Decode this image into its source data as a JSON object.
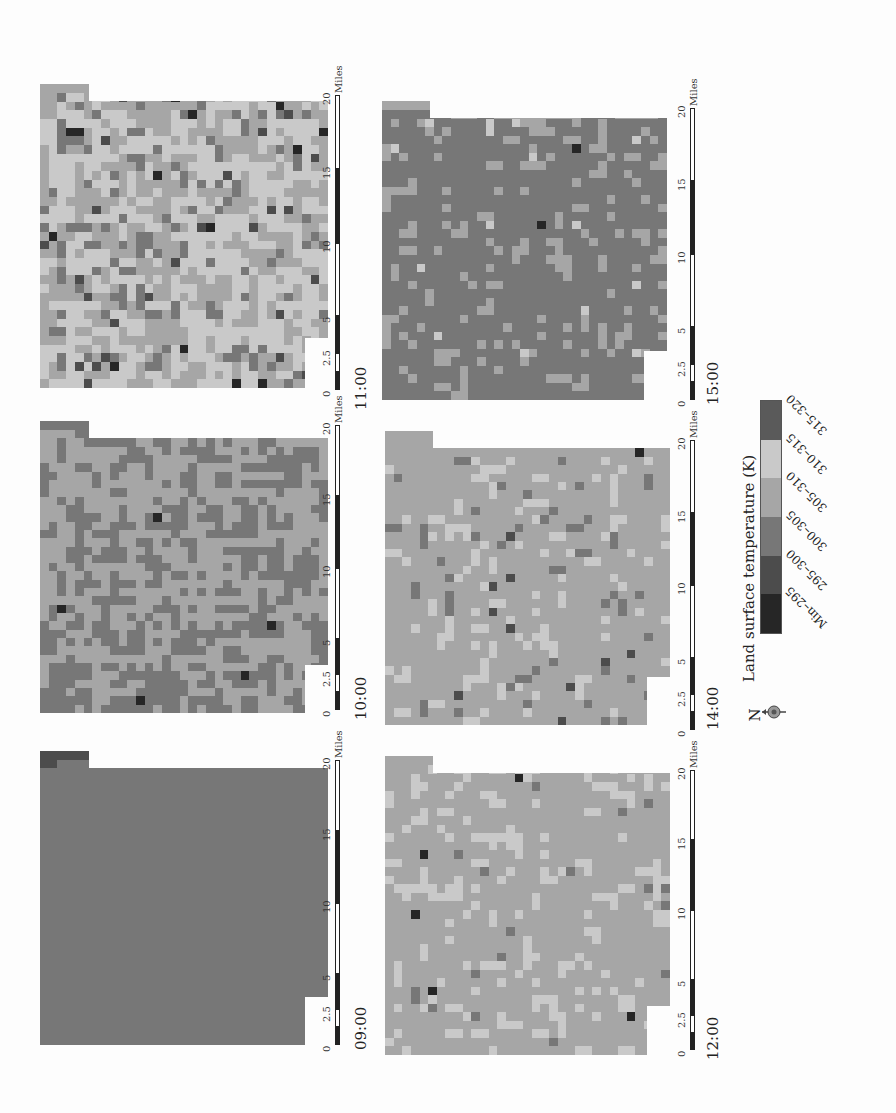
{
  "figure": {
    "orientation": "rotated 90deg clockwise",
    "legend": {
      "title": "Land surface temperature (K)",
      "classes": [
        {
          "label": "315–320",
          "color": "#5a5a5a"
        },
        {
          "label": "310–315",
          "color": "#c9c9c9"
        },
        {
          "label": "305–310",
          "color": "#a6a6a6"
        },
        {
          "label": "300–305",
          "color": "#777777"
        },
        {
          "label": "295–300",
          "color": "#4c4c4c"
        },
        {
          "label": "Min–295",
          "color": "#262626"
        }
      ]
    },
    "north_arrow": {
      "label": "N"
    },
    "scalebar": {
      "ticks": [
        "0",
        "2.5",
        "5",
        "10",
        "15",
        "20"
      ],
      "unit": "Miles"
    },
    "panels": [
      {
        "id": "p1100",
        "time": "11:00",
        "x": 40,
        "y": 93,
        "w": 288,
        "h": 295,
        "base": "#a6a6a6",
        "accents": [
          "#c9c9c9",
          "#777777",
          "#4c4c4c",
          "#262626"
        ],
        "weights": [
          0.24,
          0.08,
          0.02,
          0.01
        ],
        "scalebar_x": 335,
        "scalebar_y1": 95,
        "scalebar_y2": 390,
        "label_x": 360,
        "label_y": 410
      },
      {
        "id": "p1000",
        "time": "10:00",
        "x": 40,
        "y": 430,
        "w": 288,
        "h": 283,
        "base": "#777777",
        "accents": [
          "#a6a6a6",
          "#262626"
        ],
        "weights": [
          0.26,
          0.003
        ],
        "scalebar_x": 335,
        "scalebar_y1": 425,
        "scalebar_y2": 710,
        "label_x": 360,
        "label_y": 720
      },
      {
        "id": "p0900",
        "time": "09:00",
        "x": 40,
        "y": 760,
        "w": 288,
        "h": 285,
        "base": "#4c4c4c",
        "accents": [
          "#777777",
          "#a6a6a6",
          "#c9c9c9",
          "#262626"
        ],
        "weights": [
          0.5,
          0.005,
          0.005,
          0.003
        ],
        "scalebar_x": 335,
        "scalebar_y1": 760,
        "scalebar_y2": 1045,
        "label_x": 360,
        "label_y": 1050
      },
      {
        "id": "p1500",
        "time": "15:00",
        "x": 382,
        "y": 110,
        "w": 285,
        "h": 290,
        "base": "#a6a6a6",
        "accents": [
          "#777777",
          "#c9c9c9",
          "#262626"
        ],
        "weights": [
          0.35,
          0.01,
          0.002
        ],
        "scalebar_x": 690,
        "scalebar_y1": 108,
        "scalebar_y2": 400,
        "label_x": 712,
        "label_y": 405
      },
      {
        "id": "p1400",
        "time": "14:00",
        "x": 385,
        "y": 440,
        "w": 285,
        "h": 285,
        "base": "#a6a6a6",
        "accents": [
          "#c9c9c9",
          "#777777",
          "#4c4c4c",
          "#262626"
        ],
        "weights": [
          0.1,
          0.05,
          0.01,
          0.003
        ],
        "scalebar_x": 690,
        "scalebar_y1": 440,
        "scalebar_y2": 730,
        "label_x": 712,
        "label_y": 730
      },
      {
        "id": "p1200",
        "time": "12:00",
        "x": 385,
        "y": 765,
        "w": 285,
        "h": 290,
        "base": "#a6a6a6",
        "accents": [
          "#c9c9c9",
          "#777777",
          "#262626"
        ],
        "weights": [
          0.12,
          0.02,
          0.002
        ],
        "scalebar_x": 690,
        "scalebar_y1": 770,
        "scalebar_y2": 1050,
        "label_x": 712,
        "label_y": 1060
      }
    ]
  },
  "chart_data": {
    "type": "heatmap",
    "title": "Land surface temperature (K)",
    "panels": [
      "09:00",
      "10:00",
      "11:00",
      "12:00",
      "14:00",
      "15:00"
    ],
    "dominant_class": {
      "09:00": "295–300",
      "10:00": "300–305",
      "11:00": "305–310",
      "12:00": "305–310",
      "14:00": "305–310",
      "15:00": "305–310"
    },
    "secondary_class": {
      "09:00": "300–305",
      "10:00": "305–310",
      "11:00": "310–315",
      "12:00": "310–315",
      "14:00": "310–315",
      "15:00": "300–305"
    },
    "legend_classes": [
      "Min–295",
      "295–300",
      "300–305",
      "305–310",
      "310–315",
      "315–320"
    ],
    "scale_ticks_miles": [
      0,
      2.5,
      5,
      10,
      15,
      20
    ]
  }
}
